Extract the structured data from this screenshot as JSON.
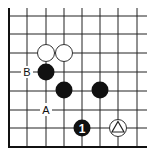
{
  "diagram": {
    "type": "go-board-fragment",
    "grid": {
      "x": [
        9,
        27,
        46,
        64,
        82,
        100,
        118,
        137
      ],
      "y": [
        16,
        34,
        53,
        72,
        91,
        110,
        128,
        147
      ],
      "right_extent": 147,
      "line_color": "#222222",
      "edges": [
        "left",
        "bottom"
      ]
    },
    "stones": [
      {
        "color": "white",
        "col": 2,
        "row": 2,
        "label": ""
      },
      {
        "color": "white",
        "col": 3,
        "row": 2,
        "label": ""
      },
      {
        "color": "black",
        "col": 2,
        "row": 3,
        "label": ""
      },
      {
        "color": "black",
        "col": 3,
        "row": 4,
        "label": ""
      },
      {
        "color": "black",
        "col": 5,
        "row": 4,
        "label": ""
      },
      {
        "color": "black",
        "col": 4,
        "row": 6,
        "label": "1"
      },
      {
        "color": "white",
        "col": 6,
        "row": 6,
        "label": "triangle"
      }
    ],
    "labels": [
      {
        "text": "B",
        "col": 1,
        "row": 3
      },
      {
        "text": "A",
        "col": 2,
        "row": 5
      }
    ]
  }
}
